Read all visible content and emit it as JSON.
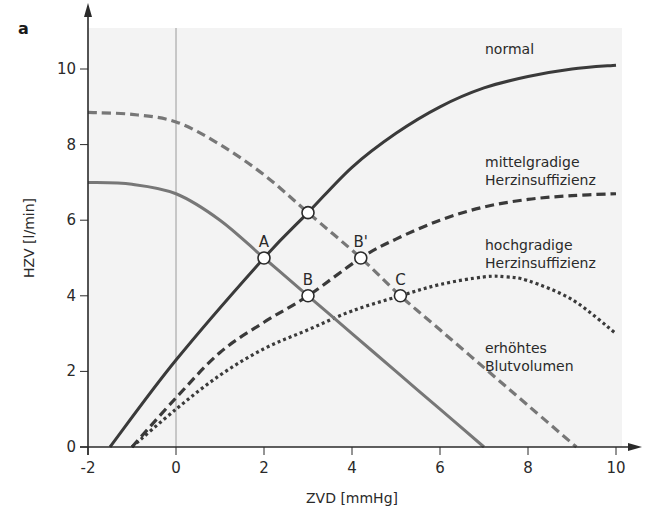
{
  "panel_label": "a",
  "colors": {
    "plot_background": "#f3f3f3",
    "dark_curve": "#3a3a3a",
    "gray_curve": "#777777",
    "axis": "#2a2a2a"
  },
  "chart_data": {
    "type": "line",
    "title": "",
    "xlabel": "ZVD [mmHg]",
    "ylabel": "HZV [l/min]",
    "xlim": [
      -2,
      10
    ],
    "ylim": [
      0,
      11
    ],
    "xticks": [
      -2,
      0,
      2,
      4,
      6,
      8,
      10
    ],
    "yticks": [
      0,
      2,
      4,
      6,
      8,
      10
    ],
    "x_tick_labels": [
      "-2",
      "0",
      "2",
      "4",
      "6",
      "8",
      "10"
    ],
    "y_tick_labels": [
      "0",
      "2",
      "4",
      "6",
      "8",
      "10"
    ],
    "grid": false,
    "reference_line_x": 0,
    "series": [
      {
        "name": "normal",
        "role": "Herzfunktionskurve",
        "style": "solid-dark",
        "points": [
          [
            -1.5,
            0
          ],
          [
            0,
            2.3
          ],
          [
            2,
            5
          ],
          [
            3,
            6.2
          ],
          [
            4,
            7.4
          ],
          [
            5,
            8.3
          ],
          [
            6,
            9.0
          ],
          [
            7,
            9.5
          ],
          [
            8,
            9.8
          ],
          [
            9,
            10.0
          ],
          [
            10,
            10.1
          ]
        ]
      },
      {
        "name": "mittelgradige Herzinsuffizienz",
        "role": "Herzfunktionskurve",
        "style": "dashed-dark",
        "points": [
          [
            -1,
            0
          ],
          [
            0,
            1.3
          ],
          [
            1,
            2.5
          ],
          [
            2,
            3.3
          ],
          [
            3,
            4.0
          ],
          [
            4.2,
            5.0
          ],
          [
            5,
            5.5
          ],
          [
            6,
            6.0
          ],
          [
            7,
            6.35
          ],
          [
            8,
            6.55
          ],
          [
            9,
            6.65
          ],
          [
            10,
            6.7
          ]
        ]
      },
      {
        "name": "hochgradige Herzinsuffizienz",
        "role": "Herzfunktionskurve",
        "style": "dotted-dark",
        "points": [
          [
            -1,
            0
          ],
          [
            0,
            1.0
          ],
          [
            1,
            1.9
          ],
          [
            2,
            2.6
          ],
          [
            3,
            3.1
          ],
          [
            4,
            3.6
          ],
          [
            5.1,
            4.0
          ],
          [
            6,
            4.3
          ],
          [
            7,
            4.5
          ],
          [
            7.5,
            4.5
          ],
          [
            8,
            4.4
          ],
          [
            9,
            3.9
          ],
          [
            10,
            3.0
          ]
        ]
      },
      {
        "name": "venöser Rückstrom (normal)",
        "role": "Gefäßfunktionskurve",
        "style": "solid-gray",
        "points": [
          [
            -2,
            7.0
          ],
          [
            -1,
            6.95
          ],
          [
            0,
            6.7
          ],
          [
            1,
            6.0
          ],
          [
            2,
            5.0
          ],
          [
            3,
            4.0
          ],
          [
            4,
            3.0
          ],
          [
            5,
            2.0
          ],
          [
            6,
            1.0
          ],
          [
            7,
            0
          ]
        ]
      },
      {
        "name": "erhöhtes Blutvolumen",
        "role": "Gefäßfunktionskurve",
        "style": "dashed-gray",
        "points": [
          [
            -2,
            8.85
          ],
          [
            -1,
            8.8
          ],
          [
            0,
            8.6
          ],
          [
            1,
            8.0
          ],
          [
            2,
            7.2
          ],
          [
            3,
            6.2
          ],
          [
            4.2,
            5.0
          ],
          [
            5.1,
            4.0
          ],
          [
            6,
            3.1
          ],
          [
            7,
            2.1
          ],
          [
            8,
            1.1
          ],
          [
            9.1,
            0
          ]
        ]
      }
    ],
    "intersection_points": [
      {
        "label": "A",
        "x": 2.0,
        "y": 5.0
      },
      {
        "label": "",
        "x": 3.0,
        "y": 6.2
      },
      {
        "label": "B",
        "x": 3.0,
        "y": 4.0
      },
      {
        "label": "B'",
        "x": 4.2,
        "y": 5.0
      },
      {
        "label": "C",
        "x": 5.1,
        "y": 4.0
      }
    ],
    "annotations": [
      {
        "lines": [
          "normal"
        ],
        "x": 6.4,
        "y": 10.4
      },
      {
        "lines": [
          "mittelgradige",
          "Herzinsuffizienz"
        ],
        "x": 6.4,
        "y": 7.4
      },
      {
        "lines": [
          "hochgradige",
          "Herzinsuffizienz"
        ],
        "x": 6.4,
        "y": 5.2
      },
      {
        "lines": [
          "erhöhtes",
          "Blutvolumen"
        ],
        "x": 6.4,
        "y": 2.5
      }
    ]
  }
}
